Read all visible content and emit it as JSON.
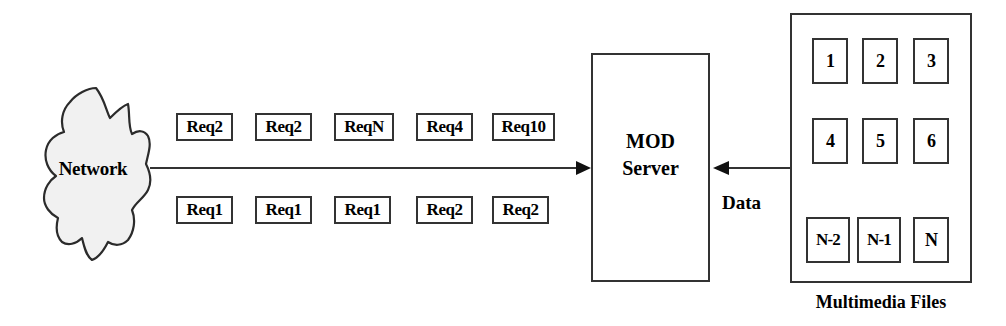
{
  "diagram": {
    "colors": {
      "stroke": "#333333",
      "cloud_fill": "#f1f1f1",
      "cloud_stroke": "#2b2b2b",
      "background": "#ffffff",
      "text": "#000000"
    },
    "network": {
      "label": "Network",
      "shape": "cloud"
    },
    "request_queues": {
      "top_row": [
        {
          "label": "Req2",
          "x": 176,
          "y": 113,
          "w": 57
        },
        {
          "label": "Req2",
          "x": 255,
          "y": 113,
          "w": 57
        },
        {
          "label": "ReqN",
          "x": 334,
          "y": 113,
          "w": 60
        },
        {
          "label": "Req4",
          "x": 416,
          "y": 113,
          "w": 57
        },
        {
          "label": "Req10",
          "x": 492,
          "y": 113,
          "w": 63
        }
      ],
      "bottom_row": [
        {
          "label": "Req1",
          "x": 176,
          "y": 196,
          "w": 57
        },
        {
          "label": "Req1",
          "x": 255,
          "y": 196,
          "w": 57
        },
        {
          "label": "Req1",
          "x": 334,
          "y": 196,
          "w": 57
        },
        {
          "label": "Req2",
          "x": 416,
          "y": 196,
          "w": 57
        },
        {
          "label": "Req2",
          "x": 492,
          "y": 196,
          "w": 57
        }
      ]
    },
    "server": {
      "line1": "MOD",
      "line2": "Server"
    },
    "data_flow": {
      "label": "Data",
      "direction": "right-to-left"
    },
    "multimedia": {
      "caption": "Multimedia Files",
      "files": [
        {
          "label": "1",
          "x": 812,
          "y": 38,
          "w": 36
        },
        {
          "label": "2",
          "x": 862,
          "y": 38,
          "w": 36
        },
        {
          "label": "3",
          "x": 913,
          "y": 38,
          "w": 36
        },
        {
          "label": "4",
          "x": 812,
          "y": 118,
          "w": 36
        },
        {
          "label": "5",
          "x": 862,
          "y": 118,
          "w": 36
        },
        {
          "label": "6",
          "x": 913,
          "y": 118,
          "w": 36
        },
        {
          "label": "N-2",
          "x": 806,
          "y": 217,
          "w": 44
        },
        {
          "label": "N-1",
          "x": 857,
          "y": 217,
          "w": 44
        },
        {
          "label": "N",
          "x": 913,
          "y": 217,
          "w": 36
        }
      ]
    }
  }
}
